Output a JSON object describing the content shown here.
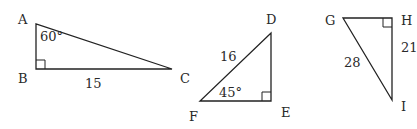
{
  "figure": {
    "triangles": [
      {
        "name": "ABC",
        "vertices": {
          "A": "A",
          "B": "B",
          "C": "C"
        },
        "right_angle_at": "B",
        "angle_label": "60°",
        "angle_at": "A",
        "side_label": "15",
        "side": "BC"
      },
      {
        "name": "DEF",
        "vertices": {
          "D": "D",
          "E": "E",
          "F": "F"
        },
        "right_angle_at": "E",
        "angle_label": "45°",
        "angle_at": "F",
        "side_label": "16",
        "side": "DF"
      },
      {
        "name": "GHI",
        "vertices": {
          "G": "G",
          "H": "H",
          "I": "I"
        },
        "right_angle_at": "H",
        "side_labels": {
          "HI": "21",
          "GI": "28"
        }
      }
    ]
  }
}
